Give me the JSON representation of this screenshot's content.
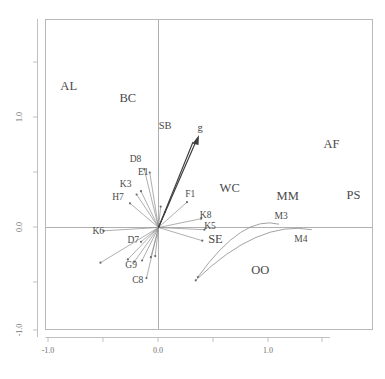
{
  "chart_data": {
    "type": "scatter",
    "title": "",
    "xlabel": "",
    "ylabel": "",
    "xlim": [
      -1.3,
      1.95
    ],
    "ylim": [
      -1.2,
      1.52
    ],
    "grid": false,
    "legend": "none",
    "axis": {
      "x_ticks_labeled": [
        "-1.0",
        "0.0",
        "1.0"
      ],
      "x_tick_values": [
        -1.0,
        0.0,
        1.0
      ],
      "x_minor_tick_values": [
        -0.5,
        0.5,
        1.5
      ],
      "y_ticks_labeled": [
        "1.0",
        "0.0",
        "-1.0"
      ],
      "y_tick_values": [
        1.0,
        0.0,
        -1.0
      ],
      "y_minor_tick_values": [
        0.5,
        -0.5
      ],
      "origin_rules": true
    },
    "group_labels": [
      {
        "text": "AL",
        "x": -0.82,
        "y": 1.25
      },
      {
        "text": "BC",
        "x": -0.28,
        "y": 1.14
      },
      {
        "text": "AF",
        "x": 1.58,
        "y": 0.72
      },
      {
        "text": "WC",
        "x": 0.65,
        "y": 0.32
      },
      {
        "text": "MM",
        "x": 1.18,
        "y": 0.25
      },
      {
        "text": "PS",
        "x": 1.78,
        "y": 0.26
      },
      {
        "text": "SE",
        "x": 0.52,
        "y": -0.14
      },
      {
        "text": "OO",
        "x": 0.93,
        "y": -0.42
      }
    ],
    "vectors": [
      {
        "label": "g",
        "x": 0.38,
        "y": 0.88,
        "tip_x": 0.36,
        "tip_y": 0.83
      },
      {
        "label": "SB",
        "x": 0.06,
        "y": 0.9
      }
    ],
    "point_labels": [
      {
        "text": "D8",
        "x": -0.21,
        "y": 0.6
      },
      {
        "text": "E1",
        "x": -0.14,
        "y": 0.48
      },
      {
        "text": "K3",
        "x": -0.3,
        "y": 0.37
      },
      {
        "text": "H7",
        "x": -0.37,
        "y": 0.25
      },
      {
        "text": "F1",
        "x": 0.29,
        "y": 0.28
      },
      {
        "text": "K8",
        "x": 0.43,
        "y": 0.09
      },
      {
        "text": "K5",
        "x": 0.47,
        "y": -0.01
      },
      {
        "text": "K6",
        "x": -0.55,
        "y": -0.06
      },
      {
        "text": "D7",
        "x": -0.23,
        "y": -0.14
      },
      {
        "text": "G9",
        "x": -0.25,
        "y": -0.37
      },
      {
        "text": "C8",
        "x": -0.19,
        "y": -0.5
      },
      {
        "text": "M3",
        "x": 1.12,
        "y": 0.08
      },
      {
        "text": "M4",
        "x": 1.3,
        "y": -0.13
      }
    ],
    "rays": [
      {
        "name": "ray-D8",
        "dx": -0.13,
        "dy": 0.53
      },
      {
        "name": "ray-E1",
        "dx": -0.08,
        "dy": 0.5
      },
      {
        "name": "ray-K3-a",
        "dx": -0.16,
        "dy": 0.33
      },
      {
        "name": "ray-K3-b",
        "dx": -0.2,
        "dy": 0.3
      },
      {
        "name": "ray-H7",
        "dx": -0.26,
        "dy": 0.22
      },
      {
        "name": "ray-upper-short",
        "dx": 0.02,
        "dy": 0.19
      },
      {
        "name": "ray-mid-a",
        "dx": 0.06,
        "dy": 0.14
      },
      {
        "name": "ray-F1",
        "dx": 0.26,
        "dy": 0.23
      },
      {
        "name": "ray-K8",
        "dx": 0.39,
        "dy": 0.08
      },
      {
        "name": "ray-K5",
        "dx": 0.42,
        "dy": -0.02
      },
      {
        "name": "ray-K6",
        "dx": -0.5,
        "dy": -0.03
      },
      {
        "name": "ray-K6-low",
        "dx": -0.53,
        "dy": -0.32
      },
      {
        "name": "ray-D7",
        "dx": -0.16,
        "dy": -0.13
      },
      {
        "name": "ray-G9-a",
        "dx": -0.28,
        "dy": -0.29
      },
      {
        "name": "ray-G9-b",
        "dx": -0.22,
        "dy": -0.31
      },
      {
        "name": "ray-G9-c",
        "dx": -0.15,
        "dy": -0.3
      },
      {
        "name": "ray-C8",
        "dx": -0.11,
        "dy": -0.46
      },
      {
        "name": "ray-lower-a",
        "dx": -0.07,
        "dy": -0.27
      },
      {
        "name": "ray-lower-b",
        "dx": -0.03,
        "dy": -0.26
      },
      {
        "name": "ray-right-flat",
        "dx": 0.4,
        "dy": -0.12
      }
    ],
    "curves": [
      {
        "name": "curve-M3",
        "start_x": 0.36,
        "start_y": -0.45,
        "end_x": 1.1,
        "end_y": 0.03
      },
      {
        "name": "curve-M4",
        "start_x": 0.34,
        "start_y": -0.48,
        "end_x": 1.4,
        "end_y": -0.02
      }
    ]
  }
}
